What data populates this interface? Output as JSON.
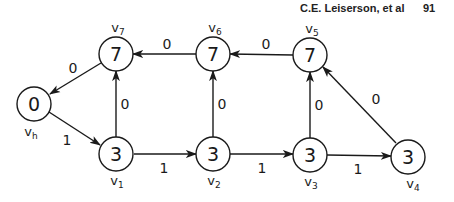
{
  "header": {
    "author": "C.E. Leiserson, et al",
    "page_number": "91"
  },
  "graph": {
    "nodes": [
      {
        "id": "vh",
        "label": "v",
        "sub": "h",
        "value": "0"
      },
      {
        "id": "v1",
        "label": "v",
        "sub": "1",
        "value": "3"
      },
      {
        "id": "v2",
        "label": "v",
        "sub": "2",
        "value": "3"
      },
      {
        "id": "v3",
        "label": "v",
        "sub": "3",
        "value": "3"
      },
      {
        "id": "v4",
        "label": "v",
        "sub": "4",
        "value": "3"
      },
      {
        "id": "v5",
        "label": "v",
        "sub": "5",
        "value": "7"
      },
      {
        "id": "v6",
        "label": "v",
        "sub": "6",
        "value": "7"
      },
      {
        "id": "v7",
        "label": "v",
        "sub": "7",
        "value": "7"
      }
    ],
    "edges": [
      {
        "from": "vh",
        "to": "v1",
        "weight": "1"
      },
      {
        "from": "v1",
        "to": "v2",
        "weight": "1"
      },
      {
        "from": "v2",
        "to": "v3",
        "weight": "1"
      },
      {
        "from": "v3",
        "to": "v4",
        "weight": "1"
      },
      {
        "from": "v1",
        "to": "v7",
        "weight": "0"
      },
      {
        "from": "v2",
        "to": "v6",
        "weight": "0"
      },
      {
        "from": "v3",
        "to": "v5",
        "weight": "0"
      },
      {
        "from": "v4",
        "to": "v5",
        "weight": "0"
      },
      {
        "from": "v5",
        "to": "v6",
        "weight": "0"
      },
      {
        "from": "v6",
        "to": "v7",
        "weight": "0"
      },
      {
        "from": "v7",
        "to": "vh",
        "weight": "0"
      }
    ]
  }
}
